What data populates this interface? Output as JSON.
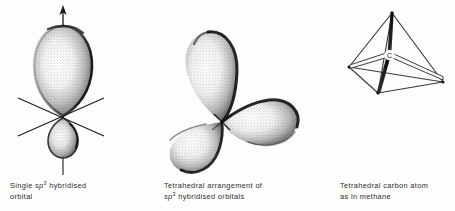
{
  "figure": {
    "background_color": "#fdfdfc",
    "ink_color": "#1c1c1c",
    "caption_color": "#2b2b2b",
    "panels": [
      {
        "id": "single-sp3-orbital",
        "diagram_type": "orbital-lobe-diagram",
        "caption": {
          "line1_pre": "Single ",
          "line1_italic": "sp",
          "line1_sup": "3",
          "line1_post": " hybridised",
          "line2": "orbital"
        },
        "elements": {
          "major_lobe": "large upper teardrop lobe",
          "minor_lobe": "small lower teardrop lobe",
          "axis_arrow": "upward axis arrow",
          "node_axes": "three crossing axis lines at node"
        }
      },
      {
        "id": "tetrahedral-arrangement",
        "diagram_type": "orbital-lobe-diagram",
        "caption": {
          "line1": "Tetrahedral arrangement of",
          "line2_italic": "sp",
          "line2_sup": "3",
          "line2_post": " hybridised  orbitals"
        },
        "elements": {
          "lobe_upper_left": "upper-left teardrop lobe",
          "lobe_lower_left": "lower-left teardrop lobe",
          "lobe_right": "right teardrop lobe",
          "node": "central convergence node"
        }
      },
      {
        "id": "tetrahedral-carbon-atom",
        "diagram_type": "tetrahedron-ball-and-stick",
        "caption": {
          "line1": "Tetrahedral carbon atom",
          "line2": "as in methane"
        },
        "elements": {
          "central_atom_label": "C",
          "vertices": 4,
          "bonds": 4,
          "edges": 6
        }
      }
    ]
  }
}
